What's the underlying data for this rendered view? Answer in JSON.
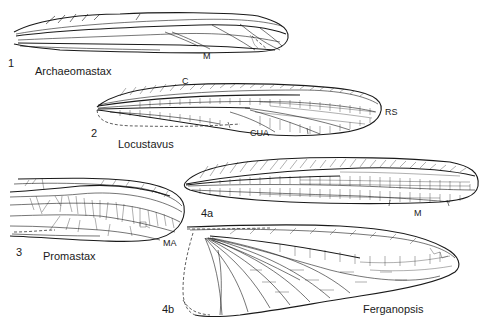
{
  "figure": {
    "panels": [
      {
        "number": "1",
        "taxon": "Archaeomastax",
        "vein_labels": [
          "M"
        ]
      },
      {
        "number": "2",
        "taxon": "Locustavus",
        "vein_labels": [
          "C",
          "RS",
          "CUA"
        ]
      },
      {
        "number": "3",
        "taxon": "Promastax",
        "vein_labels": [
          "MA"
        ]
      },
      {
        "number": "4a",
        "taxon": "",
        "vein_labels": [
          "M"
        ]
      },
      {
        "number": "4b",
        "taxon": "Ferganopsis",
        "vein_labels": []
      }
    ]
  }
}
